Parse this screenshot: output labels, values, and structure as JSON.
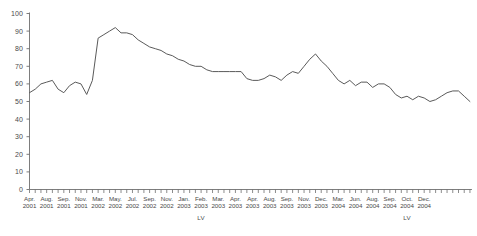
{
  "chart_data": {
    "type": "line",
    "title": "",
    "subtitle": "",
    "xlabel": "",
    "ylabel": "",
    "ylim": [
      0,
      100
    ],
    "ytick_step": 10,
    "yticks": [
      0,
      10,
      20,
      30,
      40,
      50,
      60,
      70,
      80,
      90,
      100
    ],
    "grid": false,
    "legend": "none",
    "line_color": "#5a5a5a",
    "axis_color": "#6e6e6e",
    "series": [
      {
        "name": "LV",
        "values": [
          55,
          57,
          60,
          61,
          62,
          57,
          55,
          59,
          61,
          60,
          54,
          62,
          86,
          88,
          90,
          92,
          89,
          89,
          88,
          85,
          83,
          81,
          80,
          79,
          77,
          76,
          74,
          73,
          71,
          70,
          70,
          68,
          67,
          67,
          67,
          67,
          67,
          67,
          63,
          62,
          62,
          63,
          65,
          64,
          62,
          65,
          67,
          66,
          70,
          74,
          77,
          73,
          70,
          66,
          62,
          60,
          62,
          59,
          61,
          61,
          58,
          60,
          60,
          58,
          54,
          52,
          53,
          51,
          53,
          52,
          50,
          51,
          53,
          55,
          56,
          56,
          53,
          50
        ]
      }
    ],
    "x_tick_count": 78,
    "x_labeled_ticks": [
      {
        "index": 0,
        "month": "Apr.",
        "year": "2001"
      },
      {
        "index": 3,
        "month": "Aug.",
        "year": "2001"
      },
      {
        "index": 6,
        "month": "Sep.",
        "year": "2001"
      },
      {
        "index": 9,
        "month": "Nov.",
        "year": "2001"
      },
      {
        "index": 12,
        "month": "Mar.",
        "year": "2002"
      },
      {
        "index": 15,
        "month": "May.",
        "year": "2002"
      },
      {
        "index": 18,
        "month": "Jul.",
        "year": "2002"
      },
      {
        "index": 21,
        "month": "Sep.",
        "year": "2002"
      },
      {
        "index": 24,
        "month": "Nov.",
        "year": "2002"
      },
      {
        "index": 27,
        "month": "Jan.",
        "year": "2003"
      },
      {
        "index": 30,
        "month": "Feb.",
        "year": "2003"
      },
      {
        "index": 33,
        "month": "Mar.",
        "year": "2003"
      },
      {
        "index": 36,
        "month": "Apr.",
        "year": "2003"
      },
      {
        "index": 39,
        "month": "Apr.",
        "year": "2003"
      },
      {
        "index": 42,
        "month": "Aug.",
        "year": "2003"
      },
      {
        "index": 45,
        "month": "Sep.",
        "year": "2003"
      },
      {
        "index": 48,
        "month": "Nov.",
        "year": "2003"
      },
      {
        "index": 51,
        "month": "Dec.",
        "year": "2003"
      },
      {
        "index": 54,
        "month": "Mar.",
        "year": "2004"
      },
      {
        "index": 57,
        "month": "Jun.",
        "year": "2004"
      },
      {
        "index": 60,
        "month": "Aug.",
        "year": "2004"
      },
      {
        "index": 63,
        "month": "Sep.",
        "year": "2004"
      },
      {
        "index": 66,
        "month": "Oct.",
        "year": "2004"
      },
      {
        "index": 69,
        "month": "Dec.",
        "year": "2004"
      }
    ],
    "group_labels": [
      {
        "text": "LV",
        "index": 30
      },
      {
        "text": "LV",
        "index": 66
      }
    ]
  }
}
